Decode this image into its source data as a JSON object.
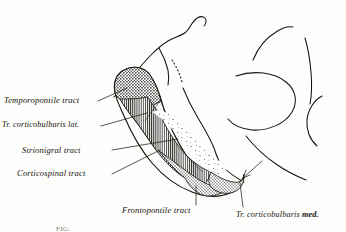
{
  "figure": {
    "kind": "anatomical-illustration",
    "style": "engraving halftone, black ink on cream paper",
    "ink_color": "#15130f",
    "paper_color": "#fdfdfb",
    "caption_fragment": "FIG."
  },
  "labels": {
    "temporopontile": "Temporopontile tract",
    "corticobulbaris_lat": "Tr. corticobulbaris lat.",
    "strionigral": "Strionigral tract",
    "corticospinal": "Corticospinal tract",
    "frontopontile": "Frontopontile tract",
    "corticobulbaris_med_prefix": "Tr. corticobulbaris ",
    "corticobulbaris_med_suffix": "med."
  },
  "regions": [
    {
      "name": "temporopontile-zone",
      "fill": "coarse-stipple",
      "position": "lateral-superior"
    },
    {
      "name": "corticobulbaris-lat-zone",
      "fill": "fine-stipple",
      "position": "lateral"
    },
    {
      "name": "corticospinal-zone",
      "fill": "vertical-hatch",
      "position": "middle"
    },
    {
      "name": "strionigral-zone",
      "fill": "sparse-dots",
      "position": "medial-interior"
    },
    {
      "name": "frontopontile-zone",
      "fill": "dense-stipple",
      "position": "medial-inferior"
    },
    {
      "name": "corticobulbaris-med-zone",
      "fill": "dense-stipple",
      "position": "medial-tip"
    }
  ]
}
